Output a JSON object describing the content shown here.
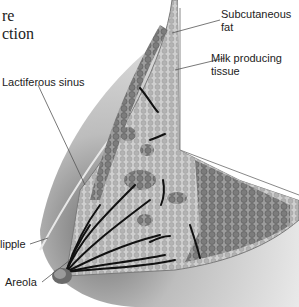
{
  "title": {
    "line1": "re",
    "line2": "ction"
  },
  "labels": {
    "subcutaneous_fat_1": "Subcutaneous",
    "subcutaneous_fat_2": "fat",
    "milk_tissue_1": "Milk producing",
    "milk_tissue_2": "tissue",
    "lactiferous_sinus": "Lactiferous sinus",
    "nipple": "lipple",
    "areola": "Areola"
  },
  "colors": {
    "skin_light": "#f2f2f2",
    "skin_shade": "#9a9a9a",
    "tissue": "#c8c8c8",
    "fat_lobules": "#8a8a8a",
    "ducts": "#111111",
    "leader_lines": "#555555"
  }
}
